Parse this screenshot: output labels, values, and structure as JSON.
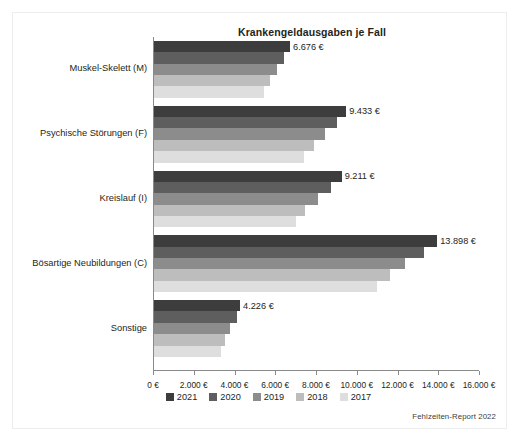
{
  "figure": {
    "source_note": "Fehlzeiten-Report 2022"
  },
  "chart_data": {
    "type": "bar",
    "orientation": "horizontal",
    "title": "Krankengeldausgaben je Fall",
    "xlabel": "",
    "ylabel": "",
    "xlim": [
      0,
      16000
    ],
    "xtick_step": 2000,
    "grid": false,
    "legend_position": "bottom",
    "currency_suffix": " €",
    "categories": [
      "Muskel-Skelett (M)",
      "Psychische Störungen (F)",
      "Kreislauf (I)",
      "Bösartige Neubildungen (C)",
      "Sonstige"
    ],
    "xtick_labels": [
      "0 €",
      "2.000 €",
      "4.000 €",
      "6.000 €",
      "8.000 €",
      "10.000 €",
      "12.000 €",
      "14.000 €",
      "16.000 €"
    ],
    "xtick_values": [
      0,
      2000,
      4000,
      6000,
      8000,
      10000,
      12000,
      14000,
      16000
    ],
    "series": [
      {
        "name": "2021",
        "color": "#3d3d3d",
        "values": [
          6676,
          9433,
          9211,
          13898,
          4226
        ],
        "labels": [
          "6.676 €",
          "9.433 €",
          "9.211 €",
          "13.898 €",
          "4.226 €"
        ]
      },
      {
        "name": "2020",
        "color": "#5e5e5e",
        "values": [
          6400,
          9000,
          8700,
          13250,
          4050
        ],
        "labels": [
          "",
          "",
          "",
          "",
          ""
        ]
      },
      {
        "name": "2019",
        "color": "#8c8c8c",
        "values": [
          6050,
          8400,
          8050,
          12300,
          3750
        ],
        "labels": [
          "",
          "",
          "",
          "",
          ""
        ]
      },
      {
        "name": "2018",
        "color": "#bdbdbd",
        "values": [
          5700,
          7850,
          7400,
          11600,
          3480
        ],
        "labels": [
          "",
          "",
          "",
          "",
          ""
        ]
      },
      {
        "name": "2017",
        "color": "#dedede",
        "values": [
          5400,
          7350,
          6950,
          10950,
          3280
        ],
        "labels": [
          "",
          "",
          "",
          "",
          ""
        ]
      }
    ]
  }
}
